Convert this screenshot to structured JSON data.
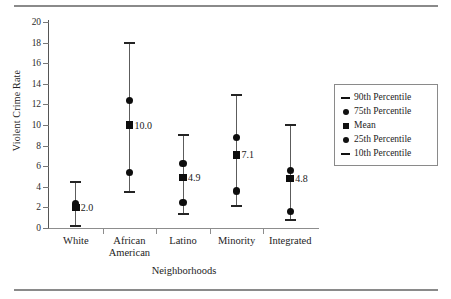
{
  "chart_data": {
    "type": "scatter",
    "title": "",
    "xlabel": "Neighborhoods",
    "ylabel": "Violent Crime Rate",
    "ylim": [
      0,
      20
    ],
    "yticks": [
      0,
      2,
      4,
      6,
      8,
      10,
      12,
      14,
      16,
      18,
      20
    ],
    "grid": false,
    "legend_position": "right",
    "categories": [
      "White",
      "African American",
      "Latino",
      "Minority",
      "Integrated"
    ],
    "category_lines": [
      [
        "White",
        ""
      ],
      [
        "African",
        "American"
      ],
      [
        "Latino",
        ""
      ],
      [
        "Minority",
        ""
      ],
      [
        "Integrated",
        ""
      ]
    ],
    "series": [
      {
        "name": "90th Percentile",
        "marker": "dash",
        "values": [
          4.5,
          18.0,
          9.0,
          12.9,
          10.0
        ]
      },
      {
        "name": "75th Percentile",
        "marker": "circle",
        "values": [
          2.4,
          12.4,
          6.3,
          8.8,
          5.6
        ]
      },
      {
        "name": "Mean",
        "marker": "square",
        "values": [
          2.0,
          10.0,
          4.9,
          7.1,
          4.8
        ]
      },
      {
        "name": "25th Percentile",
        "marker": "circle",
        "values": [
          2.0,
          5.4,
          2.45,
          3.6,
          1.6
        ]
      },
      {
        "name": "10th Percentile",
        "marker": "dash",
        "values": [
          0.2,
          3.5,
          1.35,
          2.15,
          0.75
        ]
      }
    ],
    "mean_labels": [
      "2.0",
      "10.0",
      "4.9",
      "7.1",
      "4.8"
    ],
    "legend": [
      {
        "label": "90th Percentile",
        "marker": "dash"
      },
      {
        "label": "75th Percentile",
        "marker": "circle"
      },
      {
        "label": "Mean",
        "marker": "square"
      },
      {
        "label": "25th Percentile",
        "marker": "circle"
      },
      {
        "label": "10th Percentile",
        "marker": "dash"
      }
    ],
    "colors": {
      "marker": "#0d0d0d",
      "whisker": "#5c5c5c",
      "axis": "#8d8d8d",
      "text": "#232323",
      "background": "#ffffff",
      "rule": "#8a8a8a"
    }
  }
}
